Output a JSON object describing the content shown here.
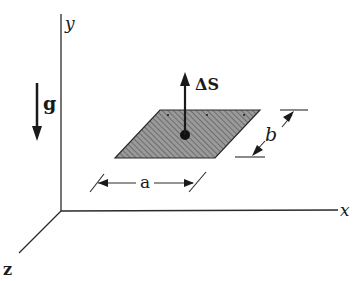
{
  "diagram": {
    "axes": {
      "x_label": "x",
      "y_label": "y",
      "z_label": "z"
    },
    "gravity": {
      "label": "g"
    },
    "surface_element": {
      "normal_label": "ΔS",
      "width_label": "a",
      "depth_label": "b",
      "fill_color": "#8a8a8a",
      "hatch_color": "#5a5a5a"
    },
    "colors": {
      "line": "#2a2a2a",
      "background": "#ffffff"
    }
  }
}
